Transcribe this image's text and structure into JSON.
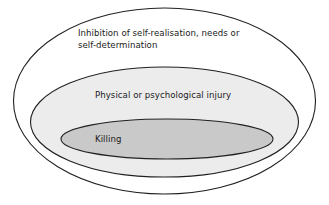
{
  "diagram": {
    "type": "nested-ellipses",
    "background_color": "#ffffff",
    "stroke_color": "#231f20",
    "text_color": "#1a1a1a",
    "levels": [
      {
        "id": "outer",
        "name": "inhibition-of-self-realisation",
        "label_lines": [
          "Inhibition of self-realisation, needs or",
          "self-determination"
        ],
        "label_text": "Inhibition of self-realisation, needs or self-determination",
        "fill_color": "#ffffff",
        "stroke_color": "#231f20",
        "stroke_width": 1.1,
        "cx": 164.5,
        "cy": 101,
        "rx": 151,
        "ry": 93,
        "label_x": 78,
        "label_y": 36
      },
      {
        "id": "middle",
        "name": "physical-or-psychological-injury",
        "label_lines": [
          "Physical or psychological injury"
        ],
        "label_text": "Physical or psychological injury",
        "fill_color": "#ececec",
        "stroke_color": "#231f20",
        "stroke_width": 1.1,
        "cx": 164.5,
        "cy": 122,
        "rx": 134,
        "ry": 55,
        "label_x": 95,
        "label_y": 98
      },
      {
        "id": "inner",
        "name": "killing",
        "label_lines": [
          "Killing"
        ],
        "label_text": "Killing",
        "fill_color": "#c9c9c9",
        "stroke_color": "#231f20",
        "stroke_width": 1.1,
        "cx": 167,
        "cy": 139,
        "rx": 106,
        "ry": 20,
        "label_x": 95,
        "label_y": 142
      }
    ]
  }
}
